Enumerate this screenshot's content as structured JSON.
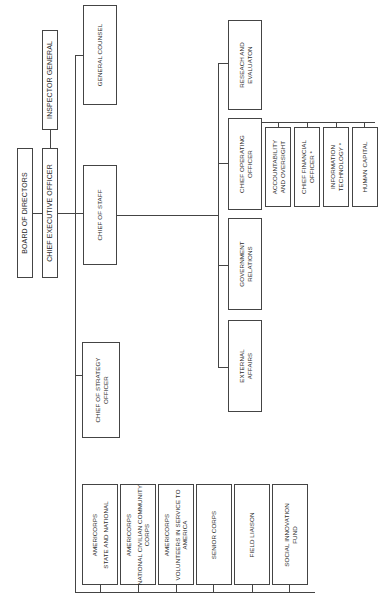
{
  "chart": {
    "orientation": "rotated-90-ccw",
    "line_color": "#444444",
    "top": {
      "board": "BOARD OF DIRECTORS",
      "ceo": "CHIEF EXECUTIVE OFFICER",
      "inspector_general": "INSPECTOR GENERAL"
    },
    "direct_reports": {
      "general_counsel": "GENERAL COUNSEL",
      "chief_of_staff": "CHIEF OF STAFF",
      "chief_strategy": [
        "CHIEF OF STRATEGY",
        "OFFICER"
      ]
    },
    "chief_of_staff_reports": {
      "research": [
        "RESEACH AND",
        "EVALUATON"
      ],
      "coo": [
        "CHIEF OPERATING",
        "OFFICER"
      ],
      "government_relations": [
        "GOVERNMENT",
        "RELATIONS"
      ],
      "external_affairs": [
        "EXTERNAL",
        "AFFAIRS"
      ]
    },
    "coo_reports": [
      [
        "ACCOUNTABILITY",
        "AND OVERSIGHT"
      ],
      [
        "CHIEF FINANCIAL",
        "OFFICER *"
      ],
      [
        "INFORMATION",
        "TECHNOLOGY *"
      ],
      [
        "HUMAN CAPITAL"
      ]
    ],
    "programs": [
      {
        "title": "AMERICORPS",
        "sub": "STATE AND NATIONAL"
      },
      {
        "title": "AMERICORPS",
        "sub": "NATIONAL CIVILIAN COMMUNITY",
        "sub2": "CORPS"
      },
      {
        "title": "AMERICORPS",
        "sub": "VOLUNTEERS IN SERVICE TO",
        "sub2": "AMERICA"
      },
      {
        "title": "SENIOR CORPS"
      },
      {
        "title": "FIELD LIAISON"
      },
      {
        "title": "SOCIAL INNOVATION",
        "sub": "FUND"
      }
    ]
  }
}
